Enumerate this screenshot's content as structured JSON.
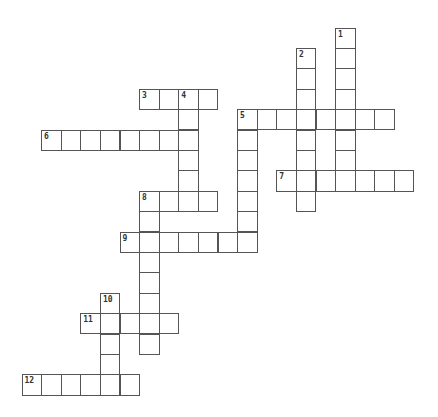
{
  "puzzle": {
    "grid": {
      "origin_x": 22,
      "origin_y": 28,
      "cell_w": 19.6,
      "cell_h": 20.4,
      "border_color": "#555555"
    },
    "words": [
      {
        "number": "1",
        "direction": "down",
        "col": 16,
        "row": 0,
        "length": 8
      },
      {
        "number": "2",
        "direction": "down",
        "col": 14,
        "row": 1,
        "length": 8
      },
      {
        "number": "3",
        "direction": "across",
        "col": 6,
        "row": 3,
        "length": 4
      },
      {
        "number": "4",
        "direction": "down",
        "col": 8,
        "row": 3,
        "length": 6
      },
      {
        "number": "5",
        "direction": "across",
        "col": 11,
        "row": 4,
        "length": 8
      },
      {
        "number": "5",
        "direction": "down",
        "col": 11,
        "row": 4,
        "length": 7
      },
      {
        "number": "6",
        "direction": "across",
        "col": 1,
        "row": 5,
        "length": 8
      },
      {
        "number": "7",
        "direction": "across",
        "col": 13,
        "row": 7,
        "length": 7
      },
      {
        "number": "8",
        "direction": "across",
        "col": 6,
        "row": 8,
        "length": 4
      },
      {
        "number": "8",
        "direction": "down",
        "col": 6,
        "row": 8,
        "length": 8
      },
      {
        "number": "9",
        "direction": "across",
        "col": 5,
        "row": 10,
        "length": 7
      },
      {
        "number": "10",
        "direction": "down",
        "col": 4,
        "row": 13,
        "length": 5
      },
      {
        "number": "11",
        "direction": "across",
        "col": 3,
        "row": 14,
        "length": 5
      },
      {
        "number": "12",
        "direction": "across",
        "col": 0,
        "row": 17,
        "length": 6
      }
    ]
  }
}
